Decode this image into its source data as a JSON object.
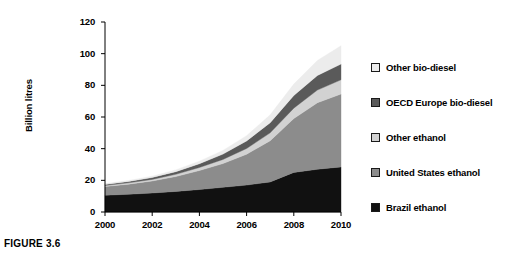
{
  "figure": {
    "caption": "FIGURE 3.6"
  },
  "chart_data": {
    "type": "area",
    "stacked": true,
    "title": "",
    "subtitle": "",
    "xlabel": "",
    "ylabel": "Billion litres",
    "xlim": [
      2000,
      2010
    ],
    "ylim": [
      0,
      120
    ],
    "grid": false,
    "legend_position": "right",
    "x": [
      2000,
      2001,
      2002,
      2003,
      2004,
      2005,
      2006,
      2007,
      2008,
      2009,
      2010
    ],
    "xtick_labels": [
      "2000",
      "2002",
      "2004",
      "2006",
      "2008",
      "2010"
    ],
    "xticks": [
      2000,
      2002,
      2004,
      2006,
      2008,
      2010
    ],
    "ytick_labels": [
      "0",
      "20",
      "40",
      "60",
      "80",
      "100",
      "120"
    ],
    "yticks": [
      0,
      20,
      40,
      60,
      80,
      100,
      120
    ],
    "series": [
      {
        "name": "Brazil ethanol",
        "color": "#111111",
        "values": [
          10.6,
          11.2,
          12.0,
          13.0,
          14.2,
          15.6,
          17.0,
          19.0,
          25.0,
          27.0,
          28.5
        ]
      },
      {
        "name": "United States ethanol",
        "color": "#8c8c8c",
        "values": [
          5.5,
          6.4,
          7.6,
          9.4,
          12.0,
          15.0,
          19.5,
          26.0,
          34.0,
          42.0,
          46.0
        ]
      },
      {
        "name": "Other ethanol",
        "color": "#d2d2d2",
        "values": [
          0.6,
          0.8,
          1.0,
          1.4,
          1.9,
          2.6,
          3.6,
          5.0,
          6.6,
          8.0,
          9.0
        ]
      },
      {
        "name": "OECD Europe bio-diesel",
        "color": "#5a5a5a",
        "values": [
          0.7,
          0.9,
          1.2,
          1.7,
          2.4,
          3.4,
          4.8,
          6.4,
          8.0,
          9.2,
          10.0
        ]
      },
      {
        "name": "Other bio-diesel",
        "color": "#ececec",
        "values": [
          0.5,
          0.6,
          0.8,
          1.1,
          1.6,
          2.3,
          3.3,
          5.0,
          7.2,
          9.5,
          11.5
        ]
      }
    ],
    "totals": [
      17.9,
      19.9,
      22.6,
      26.6,
      32.1,
      38.9,
      48.2,
      61.4,
      80.8,
      95.7,
      105.0
    ],
    "legend_entries": [
      {
        "label": "Other bio-diesel",
        "color": "#ececec"
      },
      {
        "label": "OECD Europe bio-diesel",
        "color": "#5a5a5a"
      },
      {
        "label": "Other ethanol",
        "color": "#d2d2d2"
      },
      {
        "label": "United States ethanol",
        "color": "#8c8c8c"
      },
      {
        "label": "Brazil ethanol",
        "color": "#111111"
      }
    ]
  }
}
